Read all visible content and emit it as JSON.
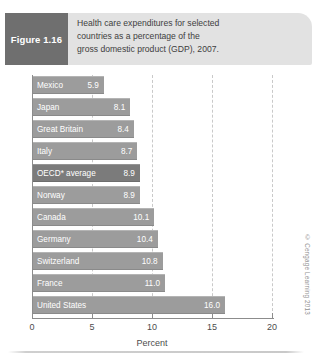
{
  "figure": {
    "label": "Figure 1.16",
    "caption_lines": [
      "Health care expenditures for selected",
      "countries as a percentage of the",
      "gross domestic product (GDP), 2007."
    ]
  },
  "credit": "© Cengage Learning 2013",
  "colors": {
    "bar": "#9c9c9c",
    "bar_highlight": "#7b7b7b",
    "header_band": "#e2e2e2",
    "label_box": "#6f6f6f",
    "gridline": "#c9c9c9",
    "axis": "#8c8c8c"
  },
  "chart_data": {
    "type": "bar",
    "orientation": "horizontal",
    "title": "Health care expenditures for selected countries as a percentage of the gross domestic product (GDP), 2007.",
    "xlabel": "Percent",
    "ylabel": "",
    "xlim": [
      0,
      20
    ],
    "xticks": [
      0,
      5,
      10,
      15,
      20
    ],
    "xtick_labels": [
      "0",
      "5",
      "10",
      "15",
      "20"
    ],
    "grid": "vertical dashed gridlines at 5, 10, 15, 20",
    "legend": "none",
    "highlighted_category": "OECD* average",
    "annotations": [
      "* asterisk on OECD average denotes footnote marker"
    ],
    "categories": [
      "Mexico",
      "Japan",
      "Great Britain",
      "Italy",
      "OECD* average",
      "Norway",
      "Canada",
      "Germany",
      "Switzerland",
      "France",
      "United States"
    ],
    "values": [
      5.9,
      8.1,
      8.4,
      8.7,
      8.9,
      8.9,
      10.1,
      10.4,
      10.8,
      11.0,
      16.0
    ],
    "value_labels": [
      "5.9",
      "8.1",
      "8.4",
      "8.7",
      "8.9",
      "8.9",
      "10.1",
      "10.4",
      "10.8",
      "11.0",
      "16.0"
    ]
  }
}
